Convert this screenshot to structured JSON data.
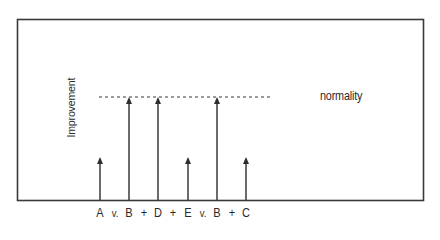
{
  "diagram": {
    "y_axis_label": "Improvement",
    "reference_line_label": "normality",
    "colors": {
      "stroke": "#3a3a3a",
      "background": "#ffffff"
    },
    "frame": {
      "left": 17,
      "top": 19,
      "right": 423,
      "bottom": 200
    },
    "reference_line": {
      "y": 97,
      "x1": 99,
      "x2": 272,
      "style": "dashed"
    },
    "arrows": [
      {
        "id": "A",
        "x": 100,
        "level": "partial",
        "tip_y": 157
      },
      {
        "id": "B",
        "x": 129,
        "level": "normality",
        "tip_y": 97
      },
      {
        "id": "D",
        "x": 158,
        "level": "normality",
        "tip_y": 97
      },
      {
        "id": "E",
        "x": 188,
        "level": "partial",
        "tip_y": 157
      },
      {
        "id": "B2",
        "x": 217,
        "level": "normality",
        "tip_y": 97
      },
      {
        "id": "C",
        "x": 246,
        "level": "partial",
        "tip_y": 157
      }
    ],
    "x_labels": [
      {
        "text": "A",
        "x": 100,
        "small": false
      },
      {
        "text": "v.",
        "x": 115,
        "small": true
      },
      {
        "text": "B",
        "x": 129,
        "small": false
      },
      {
        "text": "+",
        "x": 144,
        "small": false
      },
      {
        "text": "D",
        "x": 158,
        "small": false
      },
      {
        "text": "+",
        "x": 173,
        "small": false
      },
      {
        "text": "E",
        "x": 188,
        "small": false
      },
      {
        "text": "v.",
        "x": 203,
        "small": true
      },
      {
        "text": "B",
        "x": 217,
        "small": false
      },
      {
        "text": "+",
        "x": 232,
        "small": false
      },
      {
        "text": "C",
        "x": 246,
        "small": false
      }
    ]
  }
}
